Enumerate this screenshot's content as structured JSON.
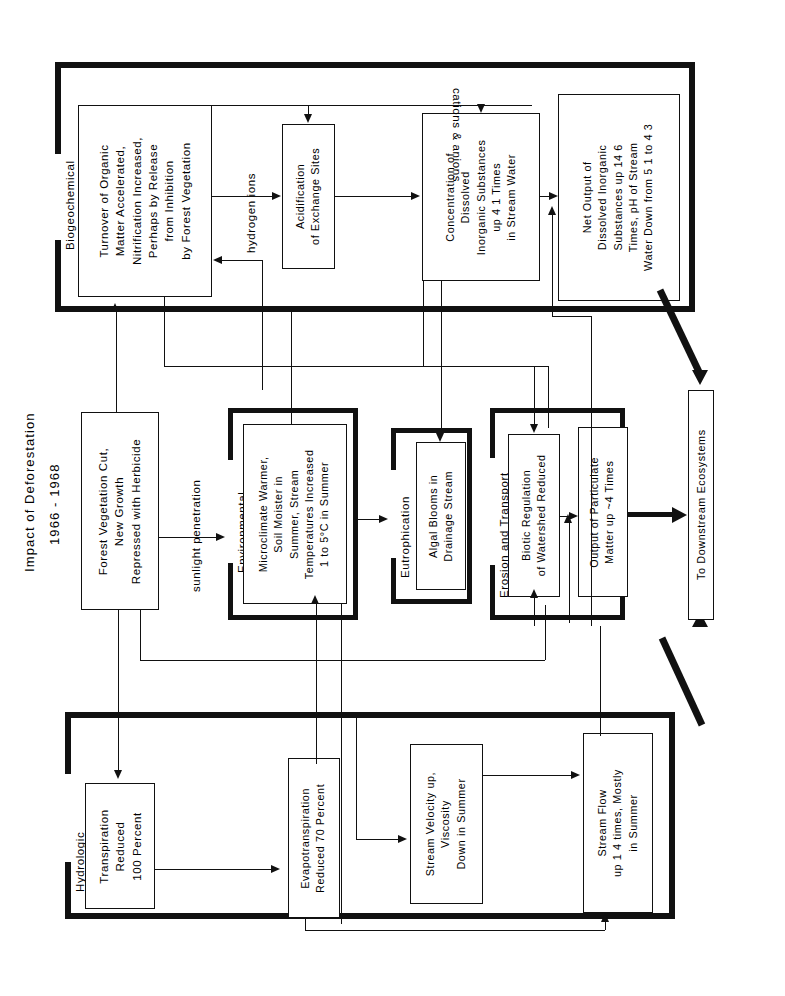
{
  "figure": {
    "title_line1": "Impact of Deforestation",
    "title_line2": "1966 - 1968",
    "orientation": "text rotated 90 degrees counter-clockwise"
  },
  "bands": [
    {
      "id": "biogeochemical",
      "label": "Biogeochemical"
    },
    {
      "id": "environmental",
      "label": "Environmental"
    },
    {
      "id": "eutrophication",
      "label": "Eutrophication"
    },
    {
      "id": "erosion",
      "label": "Erosion and Transport"
    },
    {
      "id": "hydrologic",
      "label": "Hydrologic"
    }
  ],
  "boxes": {
    "turnover": {
      "lines": [
        "Turnover of Organic",
        "Matter Accelerated,",
        "Nitrification Increased,",
        "Perhaps by Release",
        "from Inhibition",
        "by Forest Vegetation"
      ]
    },
    "acidification": {
      "lines": [
        "Acidification",
        "of Exchange Sites"
      ]
    },
    "concentration": {
      "lines": [
        "Concentration of",
        "Dissolved",
        "Inorganic Substances",
        "up 4 1 Times",
        "in Stream Water"
      ]
    },
    "net_output": {
      "lines": [
        "Net Output of",
        "Dissolved Inorganic",
        "Substances up 14 6",
        "Times, pH of Stream",
        "Water Down from 5 1 to 4 3"
      ]
    },
    "forest_cut": {
      "lines": [
        "Forest Vegetation Cut,",
        "New Growth",
        "Repressed with Herbicide"
      ]
    },
    "microclimate": {
      "lines": [
        "Microclimate Warmer,",
        "Soil Moister in",
        "Summer, Stream",
        "Temperatures Increased",
        "1 to 5°C in Summer"
      ]
    },
    "algal": {
      "lines": [
        "Algal Blooms in",
        "Drainage Stream"
      ]
    },
    "biotic": {
      "lines": [
        "Biotic Regulation",
        "of Watershed Reduced"
      ]
    },
    "particulate": {
      "lines": [
        "Output of Particulate",
        "Matter up ~4 Times"
      ]
    },
    "transpiration": {
      "lines": [
        "Transpiration",
        "Reduced",
        "100 Percent"
      ]
    },
    "evapotranspiration": {
      "lines": [
        "Evapotranspiration",
        "Reduced 70 Percent"
      ]
    },
    "stream_velocity": {
      "lines": [
        "Stream Velocity up,",
        "Viscosity",
        "Down in Summer"
      ]
    },
    "stream_flow": {
      "lines": [
        "Stream Flow",
        "up 1 4 times, Mostly",
        "in Summer"
      ]
    },
    "downstream": {
      "lines": [
        "To Downstream Ecosystems"
      ]
    }
  },
  "edge_labels": {
    "cations_anions": "cations & anions",
    "hydrogen_ions": "hydrogen ions",
    "sunlight_penetration": "sunlight penetration"
  },
  "colors": {
    "ink": "#111111",
    "paper": "#ffffff"
  }
}
